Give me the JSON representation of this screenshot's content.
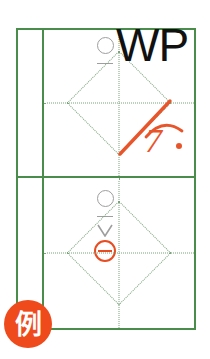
{
  "worksheet": {
    "title": "Handwriting practice grid",
    "model_character": "WP",
    "colors": {
      "grid_green": "#4a8c4a",
      "guide_dotted_green": "#7aa37a",
      "annotation_orange": "#e8552a",
      "badge_orange": "#ef4a1c",
      "mark_gray": "#9e9e9e",
      "model_char_black": "#111111",
      "paper_white": "#ffffff"
    },
    "rows": [
      {
        "name": "top-row",
        "left_column_marks": [
          {
            "icon": "circle-mark",
            "color": "#9e9e9e"
          },
          {
            "icon": "dash-mark",
            "color": "#9e9e9e"
          }
        ],
        "cell": {
          "model_character": "WP",
          "guides": [
            "vertical-center-dotted",
            "horizontal-center-dotted",
            "diamond-dotted"
          ],
          "annotations": [
            {
              "icon": "diagonal-slash-stroke",
              "color": "#e8552a"
            },
            {
              "icon": "arc-stroke",
              "color": "#e8552a"
            },
            {
              "icon": "score-numeral",
              "value": "7",
              "color": "#e8552a"
            },
            {
              "icon": "score-dot",
              "color": "#e8552a"
            }
          ]
        }
      },
      {
        "name": "bottom-row",
        "left_column_marks": [
          {
            "icon": "circle-mark",
            "color": "#9e9e9e"
          },
          {
            "icon": "dash-mark",
            "color": "#9e9e9e"
          },
          {
            "icon": "vee-mark",
            "color": "#9e9e9e"
          },
          {
            "icon": "circled-dash-mark",
            "color": "#e84c20"
          }
        ],
        "cell": {
          "model_character": "",
          "guides": [
            "vertical-center-dotted",
            "horizontal-center-dotted",
            "diamond-dotted"
          ],
          "annotations": []
        }
      }
    ],
    "badge": {
      "label": "例",
      "meaning": "example"
    },
    "score": {
      "numeral": "7",
      "suffix_dot": "."
    }
  }
}
